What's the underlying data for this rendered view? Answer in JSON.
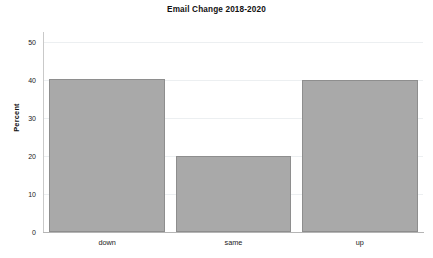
{
  "chart_data": {
    "type": "bar",
    "title": "Email Change 2018-2020",
    "xlabel": "",
    "ylabel": "Percent",
    "categories": [
      "down",
      "same",
      "up"
    ],
    "values": [
      40.3,
      20.0,
      40.0
    ],
    "ylim": [
      0,
      52
    ],
    "yticks": [
      0,
      10,
      20,
      30,
      40,
      50
    ],
    "ytick_labels": [
      "0",
      "10",
      "20",
      "30",
      "40",
      "50"
    ],
    "grid": true,
    "grid_axis": "y",
    "legend": false,
    "bar_color": "#a9a9a9",
    "bar_edge_color": "#8e8e8e",
    "background_color": "#ffffff",
    "gridline_color": "#eceff1",
    "axis_color": "#b5b5b5"
  }
}
